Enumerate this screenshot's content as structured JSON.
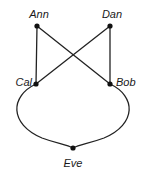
{
  "diagram": {
    "type": "graph",
    "title": "",
    "background_color": "#ffffff",
    "edge_color": "#222222",
    "node_color": "#111111",
    "label_color": "#1a1a1a",
    "nodes": [
      {
        "id": "ann",
        "label": "Ann",
        "x": 37,
        "y": 26,
        "label_x": 39,
        "label_y": 18,
        "label_anchor": "middle"
      },
      {
        "id": "dan",
        "label": "Dan",
        "x": 110,
        "y": 26,
        "label_x": 112,
        "label_y": 18,
        "label_anchor": "middle"
      },
      {
        "id": "cal",
        "label": "Cal",
        "x": 36,
        "y": 84,
        "label_x": 32,
        "label_y": 86,
        "label_anchor": "end"
      },
      {
        "id": "bob",
        "label": "Bob",
        "x": 110,
        "y": 84,
        "label_x": 116,
        "label_y": 86,
        "label_anchor": "start"
      },
      {
        "id": "eve",
        "label": "Eve",
        "x": 73,
        "y": 148,
        "label_x": 73,
        "label_y": 167,
        "label_anchor": "middle"
      }
    ],
    "edges": [
      {
        "id": "ann-cal",
        "from": "Ann",
        "to": "Cal",
        "shape": "straight",
        "path": "M 37 26 L 36 84"
      },
      {
        "id": "dan-bob",
        "from": "Dan",
        "to": "Bob",
        "shape": "straight",
        "path": "M 110 26 L 110 84"
      },
      {
        "id": "ann-bob",
        "from": "Ann",
        "to": "Bob",
        "shape": "straight",
        "path": "M 37 26 L 110 84"
      },
      {
        "id": "dan-cal",
        "from": "Dan",
        "to": "Cal",
        "shape": "straight",
        "path": "M 110 26 L 36 84"
      },
      {
        "id": "cal-eve",
        "from": "Cal",
        "to": "Eve",
        "shape": "curve-left",
        "path": "M 36 84 C 10 96 9 124 42 138 C 58 144 66 144 73 148"
      },
      {
        "id": "bob-eve",
        "from": "Bob",
        "to": "Eve",
        "shape": "curve-right",
        "path": "M 110 84 C 136 96 137 124 104 138 C 88 144 80 144 73 148"
      }
    ]
  }
}
